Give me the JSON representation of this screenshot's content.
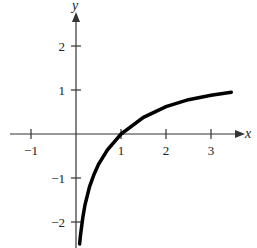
{
  "chart_data": {
    "type": "line",
    "title": "",
    "xlabel": "x",
    "ylabel": "y",
    "xlim": [
      -1.5,
      3.7
    ],
    "ylim": [
      -2.6,
      2.7
    ],
    "grid": false,
    "legend": null,
    "x_ticks": [
      -1,
      1,
      2,
      3
    ],
    "x_tick_labels": [
      "−1",
      "1",
      "2",
      "3"
    ],
    "y_ticks": [
      2,
      1,
      -1,
      -2
    ],
    "y_tick_labels": [
      "2",
      "1",
      "−1",
      "−2"
    ],
    "series": [
      {
        "name": "y = ln x",
        "x": [
          0.08,
          0.1,
          0.15,
          0.2,
          0.3,
          0.4,
          0.5,
          0.7,
          1.0,
          1.5,
          2.0,
          2.5,
          3.0,
          3.45
        ],
        "y": [
          -2.5,
          -2.3,
          -1.9,
          -1.61,
          -1.2,
          -0.92,
          -0.69,
          -0.36,
          0.0,
          0.38,
          0.62,
          0.78,
          0.88,
          0.95
        ]
      }
    ],
    "colors": {
      "axis": "#333333",
      "curve": "#000000"
    }
  }
}
